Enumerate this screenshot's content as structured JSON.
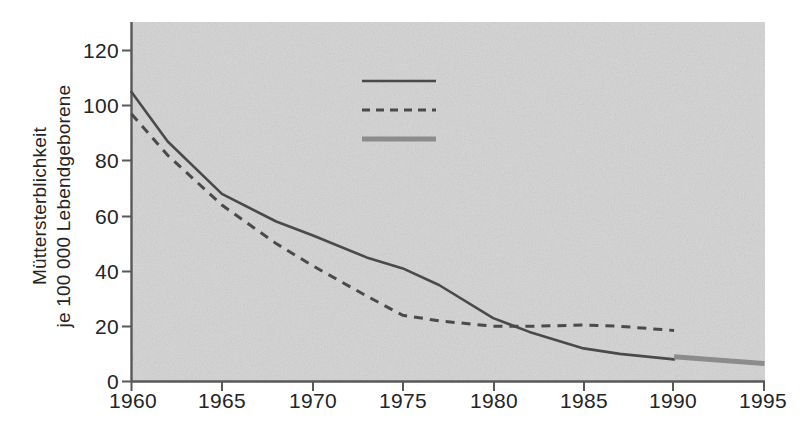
{
  "chart_data": {
    "type": "line",
    "title": "",
    "xlabel": "",
    "ylabel": "Müttersterblichkeit\nje 100 000 Lebendgeborene",
    "xlim": [
      1960,
      1995
    ],
    "ylim": [
      0,
      130
    ],
    "xticks": [
      1960,
      1965,
      1970,
      1975,
      1980,
      1985,
      1990,
      1995
    ],
    "yticks": [
      0,
      20,
      40,
      60,
      80,
      100,
      120
    ],
    "grid": false,
    "legend_position": "upper-center-right",
    "background_color": "#d4d4d4",
    "line_color": "#4a4a4a",
    "gesamt_color": "#8c8c8c",
    "series": [
      {
        "name": "Bundesrepublik Deutschland",
        "style": "solid",
        "color": "#4a4a4a",
        "x": [
          1960,
          1962,
          1965,
          1968,
          1970,
          1973,
          1975,
          1977,
          1980,
          1982,
          1985,
          1987,
          1990
        ],
        "values": [
          105,
          87,
          68,
          58,
          53,
          45,
          41,
          35,
          23,
          18,
          12,
          10,
          8
        ]
      },
      {
        "name": "DDR",
        "style": "dashed",
        "color": "#4a4a4a",
        "x": [
          1960,
          1962,
          1965,
          1968,
          1970,
          1973,
          1975,
          1977,
          1980,
          1982,
          1985,
          1987,
          1990
        ],
        "values": [
          97,
          82,
          64,
          50,
          42,
          31,
          24,
          22,
          20,
          20,
          20.5,
          20,
          18.5
        ]
      },
      {
        "name": "Deutschland gesamt",
        "style": "thick-solid",
        "color": "#8c8c8c",
        "x": [
          1990,
          1992,
          1995
        ],
        "values": [
          9,
          8,
          6.5
        ]
      }
    ]
  },
  "legend": {
    "items": [
      {
        "label": "Bundesrepublik Deutschland",
        "marker": "solid-line-marker"
      },
      {
        "label": "DDR",
        "marker": "dashed-line-marker"
      },
      {
        "label": "Deutschland gesamt",
        "marker": "thick-line-marker"
      }
    ]
  },
  "axes": {
    "y_title_line1": "Müttersterblichkeit",
    "y_title_line2": "je 100 000 Lebendgeborene",
    "y_tick_labels": [
      "120",
      "100",
      "80",
      "60",
      "40",
      "20",
      "0"
    ],
    "x_tick_labels": [
      "1960",
      "1965",
      "1970",
      "1975",
      "1980",
      "1985",
      "1990",
      "1995"
    ]
  }
}
